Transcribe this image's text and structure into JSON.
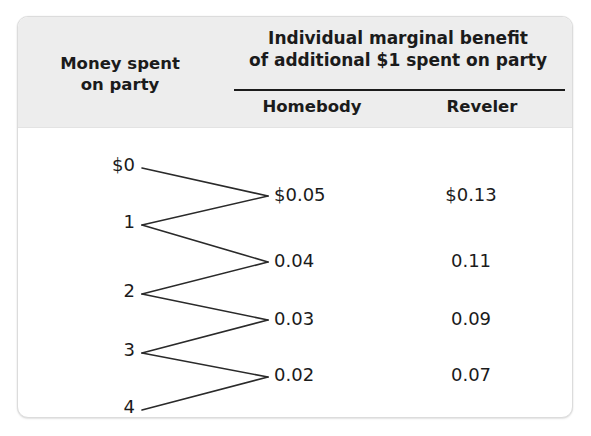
{
  "top_sliver": {
    "text": "· · · · · · · · · ·"
  },
  "table": {
    "header": {
      "row_label": "Money spent\non party",
      "row_label_line1": "Money spent",
      "row_label_line2": "on party",
      "span_label_line1": "Individual marginal benefit",
      "span_label_line2": "of additional $1 spent on party",
      "columns": [
        {
          "key": "homebody",
          "label": "Homebody"
        },
        {
          "key": "reveler",
          "label": "Reveler"
        }
      ]
    },
    "money_labels": [
      {
        "label": "$0",
        "y": 37
      },
      {
        "label": "1",
        "y": 94
      },
      {
        "label": "2",
        "y": 163
      },
      {
        "label": "3",
        "y": 222
      },
      {
        "label": "4",
        "y": 279
      }
    ],
    "rows": [
      {
        "homebody": "$0.05",
        "reveler": "$0.13",
        "y": 67
      },
      {
        "homebody": "0.04",
        "reveler": "0.11",
        "y": 133
      },
      {
        "homebody": "0.03",
        "reveler": "0.09",
        "y": 191
      },
      {
        "homebody": "0.02",
        "reveler": "0.07",
        "y": 247
      }
    ]
  },
  "chart_data": {
    "type": "table",
    "title": "Individual marginal benefit of additional $1 spent on party",
    "xlabel": "Money spent on party",
    "ylabel": "Individual marginal benefit of additional $1 spent on party",
    "categories": [
      "$0 to 1",
      "1 to 2",
      "2 to 3",
      "3 to 4"
    ],
    "money_spent_levels": [
      "$0",
      "1",
      "2",
      "3",
      "4"
    ],
    "series": [
      {
        "name": "Homebody",
        "values": [
          0.05,
          0.04,
          0.03,
          0.02
        ],
        "labels": [
          "$0.05",
          "0.04",
          "0.03",
          "0.02"
        ]
      },
      {
        "name": "Reveler",
        "values": [
          0.13,
          0.11,
          0.09,
          0.07
        ],
        "labels": [
          "$0.13",
          "0.11",
          "0.09",
          "0.07"
        ]
      }
    ]
  },
  "colors": {
    "header_bg": "#ededed",
    "card_bg": "#ffffff",
    "text": "#1b1b1b",
    "rule": "#1b1b1b",
    "border": "#dcdcdc"
  }
}
